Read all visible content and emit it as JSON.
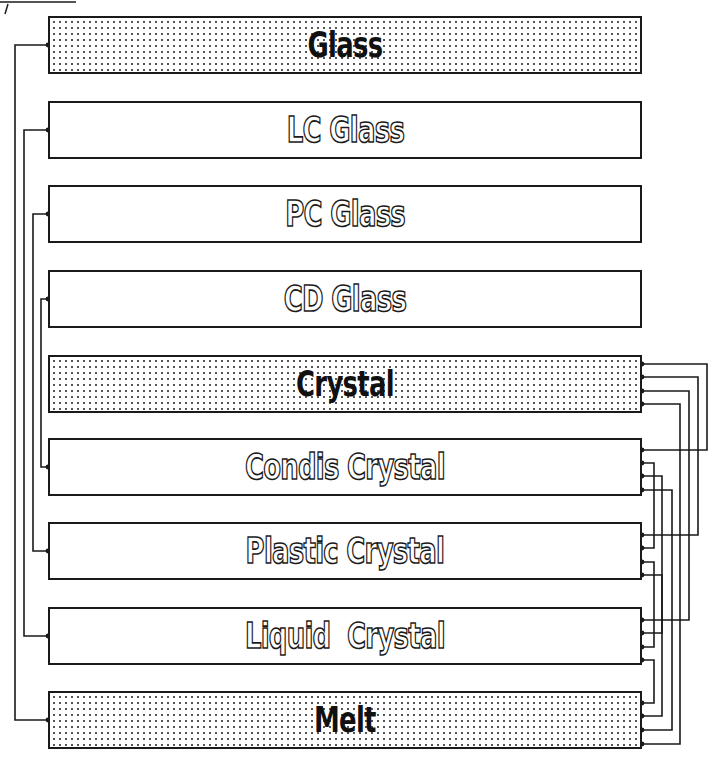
{
  "diagram": {
    "type": "phase-transition-network",
    "nodes": [
      {
        "id": "glass",
        "label": "Glass",
        "style": "solid",
        "fill": "dotted",
        "top": 16
      },
      {
        "id": "lc_glass",
        "label": "LC Glass",
        "style": "outline",
        "fill": "none",
        "top": 101
      },
      {
        "id": "pc_glass",
        "label": "PC Glass",
        "style": "outline",
        "fill": "none",
        "top": 185
      },
      {
        "id": "cd_glass",
        "label": "CD Glass",
        "style": "outline",
        "fill": "none",
        "top": 270
      },
      {
        "id": "crystal",
        "label": "Crystal",
        "style": "solid",
        "fill": "dotted",
        "top": 355
      },
      {
        "id": "condis_crystal",
        "label": "Condis Crystal",
        "style": "outline",
        "fill": "none",
        "top": 438
      },
      {
        "id": "plastic_crystal",
        "label": "Plastic Crystal",
        "style": "outline",
        "fill": "none",
        "top": 522
      },
      {
        "id": "liquid_crystal",
        "label": "Liquid  Crystal",
        "style": "outline",
        "fill": "none",
        "top": 607
      },
      {
        "id": "melt",
        "label": "Melt",
        "style": "solid",
        "fill": "dotted",
        "top": 691
      }
    ],
    "left_connections": [
      {
        "from": "glass",
        "to": "melt",
        "lane_x": 15
      },
      {
        "from": "lc_glass",
        "to": "liquid_crystal",
        "lane_x": 24
      },
      {
        "from": "pc_glass",
        "to": "plastic_crystal",
        "lane_x": 33
      },
      {
        "from": "cd_glass",
        "to": "condis_crystal",
        "lane_x": 41
      }
    ],
    "right_connections": [
      {
        "from": "crystal",
        "to": "condis_crystal",
        "y1": 364,
        "y2": 450,
        "lane_x": 707
      },
      {
        "from": "crystal",
        "to": "plastic_crystal",
        "y1": 377,
        "y2": 535,
        "lane_x": 698
      },
      {
        "from": "crystal",
        "to": "liquid_crystal",
        "y1": 391,
        "y2": 620,
        "lane_x": 689
      },
      {
        "from": "crystal",
        "to": "melt",
        "y1": 404,
        "y2": 744,
        "lane_x": 680
      },
      {
        "from": "condis_crystal",
        "to": "plastic_crystal",
        "y1": 463,
        "y2": 548,
        "lane_x": 654
      },
      {
        "from": "condis_crystal",
        "to": "liquid_crystal",
        "y1": 476,
        "y2": 633,
        "lane_x": 662
      },
      {
        "from": "condis_crystal",
        "to": "melt",
        "y1": 490,
        "y2": 730,
        "lane_x": 672
      },
      {
        "from": "plastic_crystal",
        "to": "liquid_crystal",
        "y1": 562,
        "y2": 647,
        "lane_x": 654
      },
      {
        "from": "plastic_crystal",
        "to": "melt",
        "y1": 575,
        "y2": 716,
        "lane_x": 662
      },
      {
        "from": "liquid_crystal",
        "to": "melt",
        "y1": 660,
        "y2": 703,
        "lane_x": 654
      }
    ],
    "colors": {
      "line": "#1a1a1a",
      "dot_fill": "#555555",
      "background": "#ffffff"
    }
  }
}
